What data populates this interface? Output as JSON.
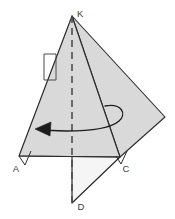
{
  "figure": {
    "kind": "geometry-diagram",
    "canvas": {
      "width": 175,
      "height": 219,
      "background": "#ffffff"
    },
    "colors": {
      "fill_primary": "#d9d9d9",
      "fill_secondary": "#f5f5f5",
      "stroke": "#2b2b2b",
      "stroke_light": "#555555",
      "axis_dash": "#4d4d4d",
      "label": "#3a3a3a"
    },
    "vertices": [
      {
        "name": "K",
        "label": "K",
        "x": 72,
        "y": 16,
        "label_x": 78,
        "label_y": 14
      },
      {
        "name": "A",
        "label": "A",
        "x": 19,
        "y": 156,
        "label_x": 16,
        "label_y": 170
      },
      {
        "name": "C",
        "label": "C",
        "x": 120,
        "y": 157,
        "label_x": 124,
        "label_y": 170
      },
      {
        "name": "D",
        "label": "D",
        "x": 72,
        "y": 203,
        "label_x": 79,
        "label_y": 207
      },
      {
        "name": "E",
        "label": "",
        "x": 165,
        "y": 117,
        "label_x": 0,
        "label_y": 0
      }
    ],
    "shapes": {
      "cone_triangle": "19,156 72,16 120,157",
      "rotated_square": "72,16 165,117 120,157",
      "lower_flap": "72,16 120,157 72,203",
      "base_chord": {
        "x1": 19,
        "y1": 156,
        "x2": 120,
        "y2": 157
      }
    },
    "axis": {
      "name": "axis-of-rotation",
      "x1": 72,
      "y1": 16,
      "x2": 72,
      "y2": 203,
      "dash": "7 5"
    },
    "markers": [
      {
        "name": "right-angle-at-A",
        "points": "19,156 31,150 26,164"
      },
      {
        "name": "right-angle-square-left-edge",
        "points": "44,54 56,54 56,80 44,80"
      },
      {
        "name": "angle-mark-at-C",
        "points": "120,157 126,152 121,164"
      }
    ],
    "rotation_arrow": {
      "name": "rotation-arrow",
      "direction": "counter-clockwise",
      "ellipse_path": "M 105,106 C 121,104 126,113 120,120 C 112,128 92,131 66,131 C 54,131 44,130 37,129",
      "arrowhead": "37,129 50,123 49,135"
    },
    "labels": [
      "K",
      "A",
      "C",
      "D"
    ]
  }
}
